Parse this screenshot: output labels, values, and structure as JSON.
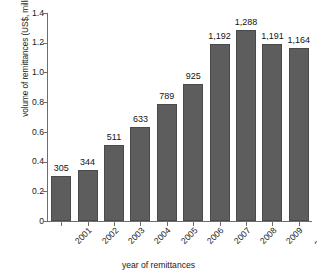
{
  "chart_data": {
    "type": "bar",
    "title": "",
    "xlabel": "year of remittances",
    "ylabel": "volume of remittances (US$, millions)",
    "categories": [
      "2001",
      "2002",
      "2003",
      "2004",
      "2005",
      "2006",
      "2007",
      "2008",
      "2009",
      "2010e"
    ],
    "values": [
      305,
      344,
      511,
      633,
      789,
      925,
      1192,
      1288,
      1191,
      1164
    ],
    "data_labels": [
      "305",
      "344",
      "511",
      "633",
      "789",
      "925",
      "1,192",
      "1,288",
      "1,191",
      "1,164"
    ],
    "ylim": [
      0,
      1.4
    ],
    "yticks": [
      0,
      0.2,
      0.4,
      0.6,
      0.8,
      1.0,
      1.2,
      1.4
    ],
    "ytick_labels": [
      "0",
      "0.2",
      "0.4",
      "0.6",
      "0.8",
      "1.0",
      "1.2",
      "1.4"
    ],
    "value_scale_divisor": 1000,
    "grid": false,
    "legend": false,
    "bar_color": "#5d5d5d",
    "axis_color": "#6d6d6d",
    "text_color": "#1a1a1a"
  }
}
